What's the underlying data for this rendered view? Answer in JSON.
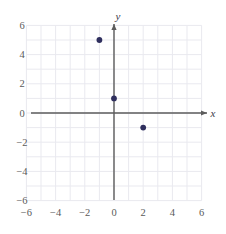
{
  "chart_data": {
    "type": "scatter",
    "title": "",
    "xlabel": "x",
    "ylabel": "y",
    "xlim": [
      -6.5,
      6.5
    ],
    "ylim": [
      -6.5,
      6.5
    ],
    "grid": true,
    "grid_step": 1,
    "legend": "none",
    "x_ticks": [
      -6,
      -4,
      -2,
      0,
      2,
      4,
      6
    ],
    "y_ticks": [
      6,
      4,
      2,
      0,
      -2,
      -4,
      -6
    ],
    "x_tick_labels": [
      "−6",
      "−4",
      "−2",
      "0",
      "2",
      "4",
      "6"
    ],
    "y_tick_labels": [
      "6",
      "4",
      "2",
      "0",
      "−2",
      "−4",
      "−6"
    ],
    "points": [
      {
        "x": -1,
        "y": 5,
        "label": "(−1, 5)"
      },
      {
        "x": 0,
        "y": 1,
        "label": "(0, 1)"
      },
      {
        "x": 2,
        "y": -1,
        "label": "(2, −1)"
      }
    ],
    "point_color": "#2f2f5e",
    "axis_color": "#5c5c5c",
    "grid_color": "#e9e9ef",
    "tick_label_color": "#5a5a5a"
  },
  "axes": {
    "x_axis_label": "x",
    "y_axis_label": "y"
  }
}
